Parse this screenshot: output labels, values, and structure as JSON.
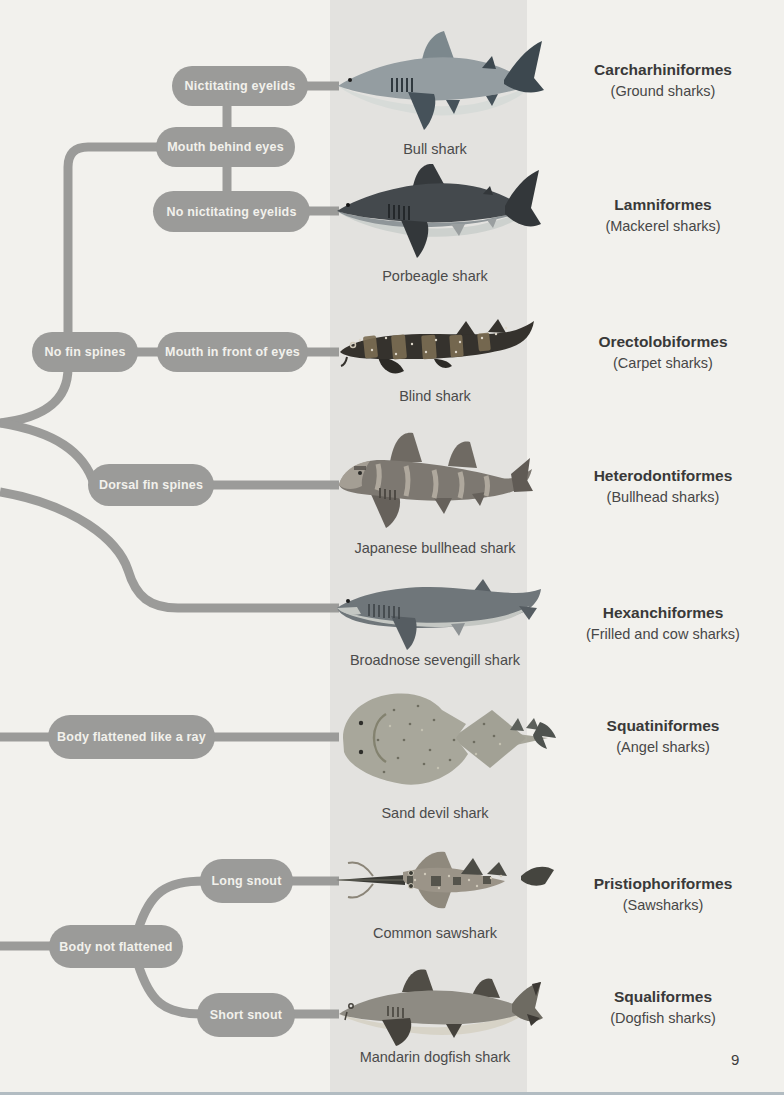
{
  "page_number": "9",
  "colors": {
    "page_background": "#f2f1ed",
    "band_background": "#e3e2df",
    "pill_background": "#9b9b99",
    "pill_text": "#f2f1ec",
    "order_name_text": "#393939",
    "caption_text": "#4b4b4b",
    "bottom_edge": "#b2bcc2"
  },
  "decision_tree": {
    "nodes": [
      {
        "id": "nictitating-eyelids",
        "label": "Nictitating eyelids"
      },
      {
        "id": "mouth-behind-eyes",
        "label": "Mouth behind eyes"
      },
      {
        "id": "no-nictitating-eyelids",
        "label": "No nictitating eyelids"
      },
      {
        "id": "no-fin-spines",
        "label": "No fin spines"
      },
      {
        "id": "mouth-in-front-of-eyes",
        "label": "Mouth in front of eyes"
      },
      {
        "id": "dorsal-fin-spines",
        "label": "Dorsal fin spines"
      },
      {
        "id": "body-flattened-like-a-ray",
        "label": "Body flattened like a ray"
      },
      {
        "id": "long-snout",
        "label": "Long snout"
      },
      {
        "id": "body-not-flattened",
        "label": "Body not flattened"
      },
      {
        "id": "short-snout",
        "label": "Short snout"
      }
    ]
  },
  "rows": [
    {
      "species": "Bull shark",
      "order": "Carcharhiniformes",
      "common_name": "(Ground sharks)"
    },
    {
      "species": "Porbeagle shark",
      "order": "Lamniformes",
      "common_name": "(Mackerel sharks)"
    },
    {
      "species": "Blind shark",
      "order": "Orectolobiformes",
      "common_name": "(Carpet sharks)"
    },
    {
      "species": "Japanese bullhead shark",
      "order": "Heterodontiformes",
      "common_name": "(Bullhead sharks)"
    },
    {
      "species": "Broadnose sevengill shark",
      "order": "Hexanchiformes",
      "common_name": "(Frilled and cow sharks)"
    },
    {
      "species": "Sand devil shark",
      "order": "Squatiniformes",
      "common_name": "(Angel sharks)"
    },
    {
      "species": "Common sawshark",
      "order": "Pristiophoriformes",
      "common_name": "(Sawsharks)"
    },
    {
      "species": "Mandarin dogfish shark",
      "order": "Squaliformes",
      "common_name": "(Dogfish sharks)"
    }
  ]
}
